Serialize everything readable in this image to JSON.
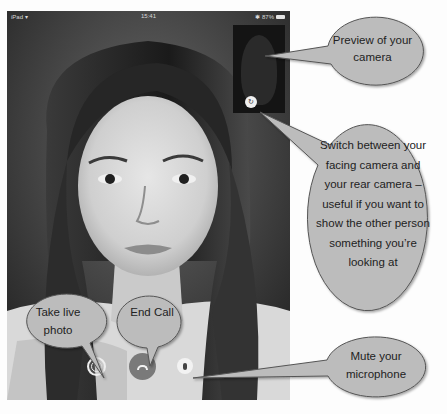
{
  "status_bar": {
    "carrier": "iPad",
    "wifi_icon": "wifi-icon",
    "time": "15:41",
    "bluetooth_icon": "bluetooth-icon",
    "battery_percent": "87%",
    "battery_icon": "battery-icon"
  },
  "call": {
    "self_preview_label": "camera-preview",
    "controls": [
      {
        "name": "switch-camera",
        "icon": "camera-switch-icon"
      },
      {
        "name": "live-photo",
        "icon": "shutter-icon"
      },
      {
        "name": "end-call",
        "icon": "phone-hangup-icon"
      },
      {
        "name": "mute",
        "icon": "microphone-icon"
      }
    ]
  },
  "callouts": {
    "preview": "Preview of your camera",
    "switch_camera": "Switch between your facing camera and your rear camera – useful if you want to show the other person something you’re looking at",
    "live_photo": "Take live photo",
    "end_call": "End Call",
    "mute": "Mute your microphone"
  },
  "colors": {
    "bubble_fill": "#bcbcbc",
    "bubble_stroke": "#555555",
    "end_call_button": "#7a7a7a",
    "screen_background": "#2a2a2a"
  }
}
